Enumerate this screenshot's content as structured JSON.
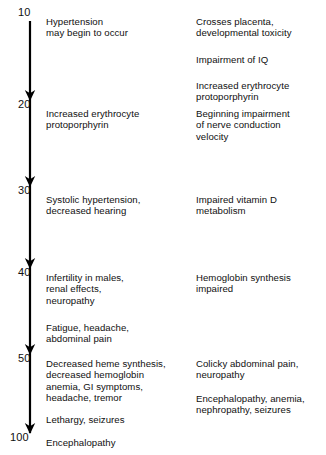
{
  "diagram": {
    "type": "blood-lead-level-effects-scale",
    "axis": {
      "name": "blood-lead-level-axis",
      "orientation": "vertical",
      "direction": "downward",
      "ticks": [
        {
          "value": "10",
          "y": 12,
          "arrow": false
        },
        {
          "value": "20",
          "y": 104,
          "arrow": true
        },
        {
          "value": "30",
          "y": 190,
          "arrow": true
        },
        {
          "value": "40",
          "y": 272,
          "arrow": true
        },
        {
          "value": "50",
          "y": 358,
          "arrow": true
        },
        {
          "value": "100",
          "y": 437,
          "arrow": true
        }
      ]
    },
    "left_column": [
      {
        "id": "left-10",
        "y": 16,
        "text": "Hypertension\nmay begin to occur"
      },
      {
        "id": "left-20",
        "y": 108,
        "text": "Increased erythrocyte\nprotoporphyrin"
      },
      {
        "id": "left-30",
        "y": 194,
        "text": "Systolic hypertension,\ndecreased hearing"
      },
      {
        "id": "left-40",
        "y": 272,
        "text": "Infertility in males,\nrenal effects,\nneuropathy"
      },
      {
        "id": "left-45",
        "y": 322,
        "text": "Fatigue, headache,\nabdominal pain"
      },
      {
        "id": "left-50",
        "y": 358,
        "text": "Decreased heme synthesis,\ndecreased hemoglobin\nanemia, GI symptoms,\nheadache, tremor"
      },
      {
        "id": "left-55",
        "y": 414,
        "text": "Lethargy, seizures"
      },
      {
        "id": "left-100",
        "y": 437,
        "text": "Encephalopathy"
      }
    ],
    "right_column": [
      {
        "id": "right-10",
        "y": 16,
        "text": "Crosses placenta,\ndevelopmental toxicity"
      },
      {
        "id": "right-15",
        "y": 54,
        "text": "Impairment of IQ"
      },
      {
        "id": "right-18",
        "y": 80,
        "text": "Increased erythrocyte\nprotoporphyrin"
      },
      {
        "id": "right-20",
        "y": 108,
        "text": "Beginning impairment\nof nerve conduction\nvelocity"
      },
      {
        "id": "right-30",
        "y": 194,
        "text": "Impaired vitamin D\nmetabolism"
      },
      {
        "id": "right-40",
        "y": 272,
        "text": "Hemoglobin synthesis\nimpaired"
      },
      {
        "id": "right-50",
        "y": 358,
        "text": "Colicky abdominal pain,\nneuropathy"
      },
      {
        "id": "right-55",
        "y": 393,
        "text": "Encephalopathy, anemia,\nnephropathy, seizures"
      }
    ],
    "colors": {
      "background": "#ffffff",
      "text": "#101010",
      "axis": "#000000"
    }
  }
}
